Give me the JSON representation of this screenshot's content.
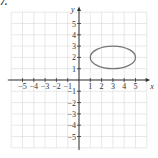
{
  "problem_label": "7.",
  "chart_data": {
    "type": "line",
    "title": "",
    "xlabel": "x",
    "ylabel": "y",
    "xlim": [
      -5,
      5
    ],
    "ylim": [
      -5,
      5
    ],
    "grid": true,
    "x_ticks": [
      -5,
      -4,
      -3,
      -2,
      -1,
      1,
      2,
      3,
      4,
      5
    ],
    "y_ticks": [
      -5,
      -4,
      -3,
      -2,
      -1,
      1,
      2,
      3,
      4,
      5
    ],
    "series": [
      {
        "name": "ellipse",
        "shape": "ellipse",
        "center": [
          3,
          2
        ],
        "rx": 2,
        "ry": 1,
        "color": "#777777"
      }
    ]
  },
  "colors": {
    "grid": "#d9d9d9",
    "axis": "#333333",
    "curve": "#777777"
  }
}
